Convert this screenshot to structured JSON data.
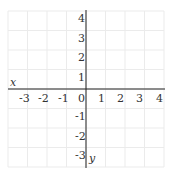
{
  "grid": {
    "x_min": -4,
    "x_max": 4,
    "y_min": -4,
    "y_max": 4,
    "origin_px": [
      86,
      89
    ],
    "cell_px": 19.5,
    "grid_color": "#ebebeb",
    "axis_color": "#222222"
  },
  "axes": {
    "x_label": "x",
    "y_label": "y"
  },
  "x_ticks": [
    "-3",
    "-2",
    "-1",
    "0",
    "1",
    "2",
    "3",
    "4"
  ],
  "y_ticks": [
    "4",
    "3",
    "2",
    "1",
    "-1",
    "-2",
    "-3"
  ]
}
